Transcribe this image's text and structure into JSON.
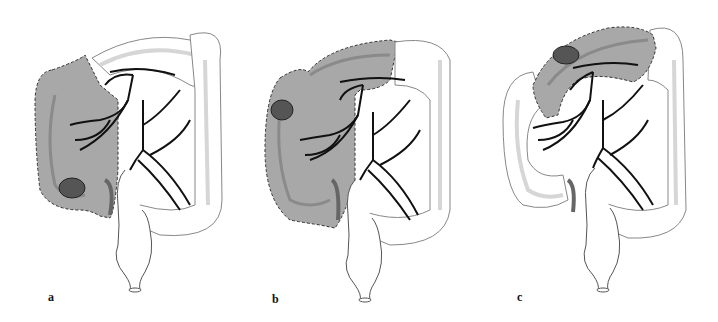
{
  "figure": {
    "panels": [
      {
        "id": "a",
        "label": "a",
        "resection": "right-hemicolectomy",
        "tumor_site": "cecum"
      },
      {
        "id": "b",
        "label": "b",
        "resection": "extended-right-hemicolectomy",
        "tumor_site": "hepatic-flexure"
      },
      {
        "id": "c",
        "label": "c",
        "resection": "transverse-colectomy",
        "tumor_site": "transverse-colon"
      }
    ],
    "colors": {
      "shaded_region": "#a8a8a8",
      "tumor": "#555555",
      "vessels": "#111111",
      "colon_outline": "#8a8a8a",
      "taenia": "#d6d6d6",
      "background": "#ffffff"
    }
  }
}
